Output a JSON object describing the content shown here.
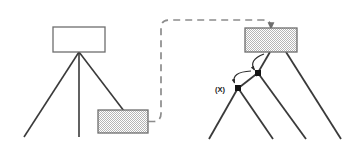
{
  "diagram": {
    "background_color": "#ffffff",
    "colors": {
      "box_stroke": "#6e6e6e",
      "box_fill_empty": "#ffffff",
      "box_fill_hatched": "#d9d9d9",
      "tree_edge": "#3a3a3a",
      "dashed_connector": "#8c8c8c",
      "node_marker": "#141414",
      "label_text": "#1a1a1a",
      "curved_arrow": "#2b2b2b"
    },
    "left_tree": {
      "name": "source-tree",
      "root_box": {
        "label": "",
        "fill_style": "empty",
        "x": 53,
        "y": 27,
        "width": 52,
        "height": 25
      },
      "apex": {
        "x": 79,
        "y": 52
      },
      "branches": [
        {
          "name": "branch-left",
          "x1": 79,
          "y1": 52,
          "x2": 24,
          "y2": 137
        },
        {
          "name": "branch-middle",
          "x1": 79,
          "y1": 52,
          "x2": 79,
          "y2": 137
        },
        {
          "name": "branch-right",
          "x1": 79,
          "y1": 52,
          "x2": 124,
          "y2": 110
        }
      ],
      "subtree_box": {
        "label": "",
        "fill_style": "hatched",
        "x": 98,
        "y": 110,
        "width": 50,
        "height": 23
      }
    },
    "transfer_arrow": {
      "name": "transfer-connector",
      "style": "dashed",
      "from": "left-hatched-box",
      "to": "right-root-box",
      "corner_radius": 8,
      "path_points": [
        {
          "x": 150,
          "y": 122
        },
        {
          "x": 161,
          "y": 122
        },
        {
          "x": 161,
          "y": 20
        },
        {
          "x": 271,
          "y": 20
        },
        {
          "x": 271,
          "y": 26
        }
      ]
    },
    "right_tree": {
      "name": "result-tree",
      "root_box": {
        "label": "",
        "fill_style": "hatched",
        "x": 245,
        "y": 28,
        "width": 52,
        "height": 24
      },
      "nodes": [
        {
          "name": "node-upper",
          "label": "",
          "x": 258,
          "y": 73,
          "size": 6
        },
        {
          "name": "node-lower",
          "label": "(X)",
          "x": 238,
          "y": 88,
          "size": 6
        }
      ],
      "branches": [
        {
          "name": "edge-root-to-upper",
          "x1": 269,
          "y1": 52,
          "x2": 258,
          "y2": 73
        },
        {
          "name": "edge-root-right",
          "x1": 286,
          "y1": 52,
          "x2": 340,
          "y2": 140
        },
        {
          "name": "edge-upper-to-lower",
          "x1": 258,
          "y1": 73,
          "x2": 238,
          "y2": 88
        },
        {
          "name": "edge-upper-down-right",
          "x1": 258,
          "y1": 73,
          "x2": 305,
          "y2": 140
        },
        {
          "name": "edge-lower-left",
          "x1": 238,
          "y1": 88,
          "x2": 210,
          "y2": 140
        },
        {
          "name": "edge-lower-right",
          "x1": 238,
          "y1": 88,
          "x2": 272,
          "y2": 140
        }
      ],
      "curved_arrows": [
        {
          "name": "curve-root-to-upper-node",
          "start": {
            "x": 263,
            "y": 54
          },
          "control": {
            "x": 248,
            "y": 60
          },
          "end": {
            "x": 254,
            "y": 71
          }
        },
        {
          "name": "curve-upper-to-lower-node",
          "start": {
            "x": 252,
            "y": 71
          },
          "control": {
            "x": 232,
            "y": 72
          },
          "end": {
            "x": 235,
            "y": 83
          }
        }
      ]
    },
    "labels": [
      {
        "name": "label-x",
        "text": "(X)",
        "x": 222,
        "y": 91
      }
    ]
  }
}
